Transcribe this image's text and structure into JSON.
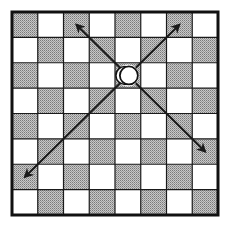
{
  "diagram": {
    "board": {
      "files": 8,
      "ranks": 8,
      "top_left_shaded": true,
      "colors": {
        "light": "#ffffff",
        "dark": "#bdbdbd",
        "dark_stipple": "#8a8a8a",
        "grid": "#1a1a1a",
        "border": "#111111"
      }
    },
    "piece": {
      "type": "circle-piece",
      "col": 4,
      "row": 2,
      "fill": "#ffffff",
      "outline": "#111111"
    },
    "arrows": [
      {
        "name": "arrow-up-left",
        "to_col": 2,
        "to_row": 0
      },
      {
        "name": "arrow-up-right",
        "to_col": 6,
        "to_row": 0
      },
      {
        "name": "arrow-down-left",
        "to_col": 0,
        "to_row": 6
      },
      {
        "name": "arrow-down-right",
        "to_col": 7,
        "to_row": 5
      }
    ],
    "arrow_color": "#1a1a1a"
  }
}
